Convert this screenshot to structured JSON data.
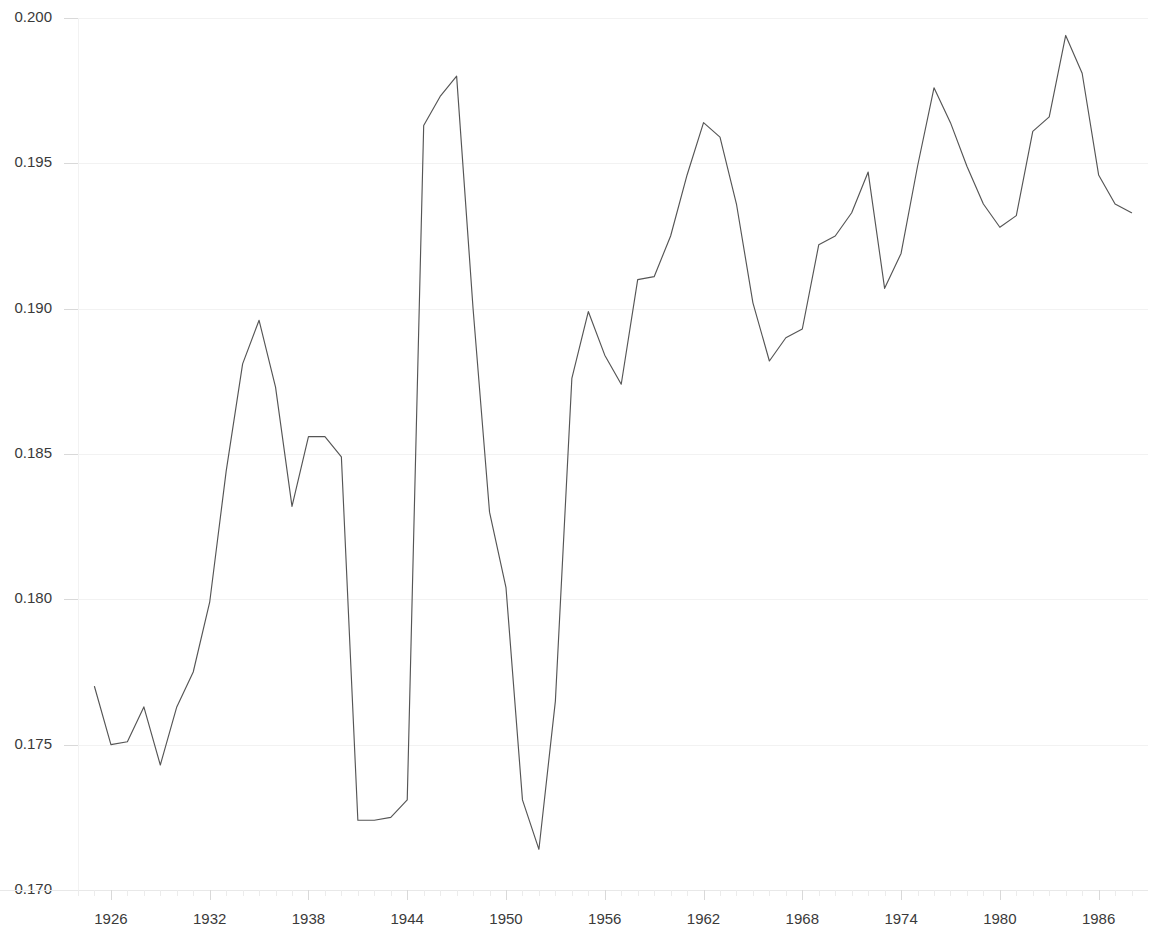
{
  "chart_data": {
    "type": "line",
    "title": "",
    "subtitle": "",
    "xlabel": "",
    "ylabel": "",
    "xlim": [
      1924,
      1989
    ],
    "ylim": [
      0.17,
      0.2
    ],
    "grid": true,
    "legend": false,
    "legend_position": "none",
    "line_color": "#555555",
    "background_color": "#ffffff",
    "text_color": "#3a3a3a",
    "gridline_color": "#f2f2f2",
    "y_ticks": [
      0.17,
      0.175,
      0.18,
      0.185,
      0.19,
      0.195,
      0.2
    ],
    "y_tick_labels": [
      "0.170",
      "0.175",
      "0.180",
      "0.185",
      "0.190",
      "0.195",
      "0.200"
    ],
    "x_ticks": [
      1926,
      1932,
      1938,
      1944,
      1950,
      1956,
      1962,
      1968,
      1974,
      1980,
      1986
    ],
    "x_tick_labels": [
      "1926",
      "1932",
      "1938",
      "1944",
      "1950",
      "1956",
      "1962",
      "1968",
      "1974",
      "1980",
      "1986"
    ],
    "x_tick_step": 6,
    "x_minor_tick_step": 1,
    "series": [
      {
        "name": "series-1",
        "color": "#555555",
        "x": [
          1925,
          1926,
          1927,
          1928,
          1929,
          1930,
          1931,
          1932,
          1933,
          1934,
          1935,
          1936,
          1937,
          1938,
          1939,
          1940,
          1941,
          1942,
          1943,
          1944,
          1945,
          1946,
          1947,
          1948,
          1949,
          1950,
          1951,
          1952,
          1953,
          1954,
          1955,
          1956,
          1957,
          1958,
          1959,
          1960,
          1961,
          1962,
          1963,
          1964,
          1965,
          1966,
          1967,
          1968,
          1969,
          1970,
          1971,
          1972,
          1973,
          1974,
          1975,
          1976,
          1977,
          1978,
          1979,
          1980,
          1981,
          1982,
          1983,
          1984,
          1985,
          1986,
          1987,
          1988
        ],
        "values": [
          0.177,
          0.175,
          0.1751,
          0.1763,
          0.1743,
          0.1763,
          0.1775,
          0.1799,
          0.1844,
          0.1881,
          0.1896,
          0.1873,
          0.1832,
          0.1856,
          0.1856,
          0.1849,
          0.1724,
          0.1724,
          0.1725,
          0.1731,
          0.1963,
          0.1973,
          0.198,
          0.19,
          0.183,
          0.1804,
          0.1731,
          0.1714,
          0.1765,
          0.1876,
          0.1899,
          0.1884,
          0.1874,
          0.191,
          0.1911,
          0.1925,
          0.1946,
          0.1964,
          0.1959,
          0.1936,
          0.1902,
          0.1882,
          0.189,
          0.1893,
          0.1922,
          0.1925,
          0.1933,
          0.1947,
          0.1907,
          0.1919,
          0.1949,
          0.1976,
          0.1964,
          0.1949,
          0.1936,
          0.1928,
          0.1932,
          0.1961,
          0.1966,
          0.1994,
          0.1981,
          0.1946,
          0.1936,
          0.1933
        ]
      }
    ]
  }
}
